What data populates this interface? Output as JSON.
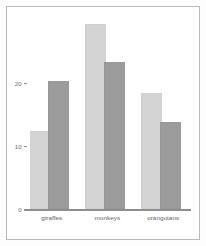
{
  "chart_data": {
    "type": "bar",
    "title": "",
    "subtitle": "",
    "xlabel": "",
    "ylabel": "",
    "categories": [
      "giraffes",
      "monkeys",
      "orangutans"
    ],
    "series": [
      {
        "name": "series-1",
        "color": "#d4d4d4",
        "values": [
          12,
          29,
          18
        ]
      },
      {
        "name": "series-2",
        "color": "#9c9c9c",
        "values": [
          20,
          23,
          13.5
        ]
      }
    ],
    "yticks": [
      0,
      10,
      20
    ],
    "ytick_labels": [
      "0",
      "10",
      "20"
    ],
    "ylim": [
      0,
      32
    ],
    "grid": false,
    "legend": "none",
    "orientation": "vertical",
    "grouped": true
  },
  "figure": {
    "background_color": "#fdfdfd",
    "plot_background_color": "#ffffff",
    "border_color": "#b9b9b9",
    "axis_color": "#8e8e8e",
    "tick_text_color": "#6d6d6d",
    "category_text_color": "#5e5e5e"
  }
}
